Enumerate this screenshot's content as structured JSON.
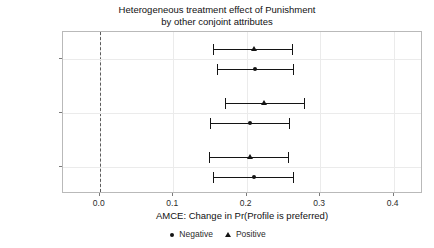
{
  "chart_data": {
    "type": "scatter",
    "title": "Heterogeneous treatment effect of Punishment by other conjoint attributes",
    "title_lines": [
      "Heterogeneous treatment effect of Punishment",
      "by other conjoint attributes"
    ],
    "xlabel": "AMCE: Change in Pr(Profile is preferred)",
    "ylabel": "",
    "xlim": [
      -0.05,
      0.44
    ],
    "xticks": [
      0.0,
      0.1,
      0.2,
      0.3,
      0.4
    ],
    "xtick_labels": [
      "0.0",
      "0.1",
      "0.2",
      "0.3",
      "0.4"
    ],
    "categories": [
      "By Growth",
      "By Welfare",
      "By Election"
    ],
    "grid": true,
    "legend_position": "bottom",
    "reference_line": 0.0,
    "legend": [
      {
        "name": "Negative",
        "marker": "circle"
      },
      {
        "name": "Positive",
        "marker": "triangle"
      }
    ],
    "series": [
      {
        "name": "Positive",
        "marker": "triangle",
        "points": [
          {
            "group": "By Growth",
            "estimate": 0.21,
            "ci_low": 0.154,
            "ci_high": 0.263
          },
          {
            "group": "By Welfare",
            "estimate": 0.223,
            "ci_low": 0.171,
            "ci_high": 0.279
          },
          {
            "group": "By Election",
            "estimate": 0.204,
            "ci_low": 0.149,
            "ci_high": 0.258
          }
        ]
      },
      {
        "name": "Negative",
        "marker": "circle",
        "points": [
          {
            "group": "By Growth",
            "estimate": 0.212,
            "ci_low": 0.16,
            "ci_high": 0.265
          },
          {
            "group": "By Welfare",
            "estimate": 0.205,
            "ci_low": 0.15,
            "ci_high": 0.259
          },
          {
            "group": "By Election",
            "estimate": 0.21,
            "ci_low": 0.154,
            "ci_high": 0.265
          }
        ]
      }
    ],
    "colors": {
      "point": "#141414",
      "grid": "#ebebeb",
      "panel_border": "#b9b9b9",
      "reference_line": "#5c5c5c",
      "background": "#ffffff"
    }
  }
}
